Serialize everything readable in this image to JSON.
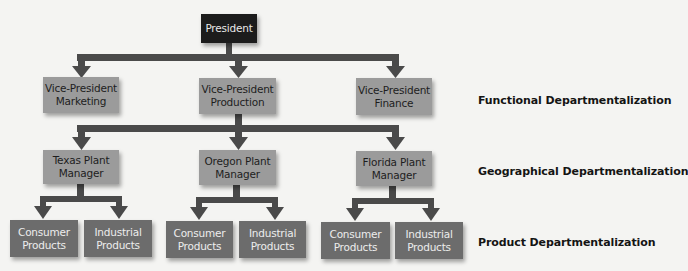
{
  "diagram": {
    "type": "org-chart",
    "colors": {
      "background": "#f4f4f2",
      "president_box": "#1c1c1c",
      "mid_box": "#9b9b9b",
      "leaf_box": "#6c6c6c",
      "connector": "#4a4a4a"
    },
    "president": {
      "label": "President"
    },
    "vice_presidents": [
      {
        "line1": "Vice-President",
        "line2": "Marketing"
      },
      {
        "line1": "Vice-President",
        "line2": "Production"
      },
      {
        "line1": "Vice-President",
        "line2": "Finance"
      }
    ],
    "plant_managers": [
      {
        "line1": "Texas Plant",
        "line2": "Manager",
        "products": [
          {
            "line1": "Consumer",
            "line2": "Products"
          },
          {
            "line1": "Industrial",
            "line2": "Products"
          }
        ]
      },
      {
        "line1": "Oregon Plant",
        "line2": "Manager",
        "products": [
          {
            "line1": "Consumer",
            "line2": "Products"
          },
          {
            "line1": "Industrial",
            "line2": "Products"
          }
        ]
      },
      {
        "line1": "Florida Plant",
        "line2": "Manager",
        "products": [
          {
            "line1": "Consumer",
            "line2": "Products"
          },
          {
            "line1": "Industrial",
            "line2": "Products"
          }
        ]
      }
    ],
    "level_labels": {
      "functional": "Functional Departmentalization",
      "geographical": "Geographical Departmentalization",
      "product": "Product Departmentalization"
    }
  }
}
